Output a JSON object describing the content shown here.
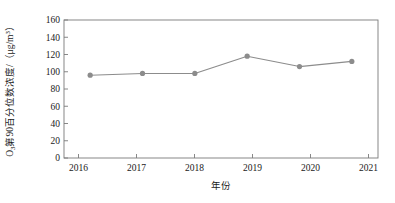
{
  "chart_data": {
    "type": "line",
    "title": "",
    "subtitle": "",
    "xlabel": "年份",
    "ylabel": "O3第90百分位数浓度/（μg/m3）",
    "ylabel_parts": {
      "lead": "O",
      "lead_sub": "3",
      "middle": "第90百分位数浓度/（μg/m",
      "unit_sup": "3",
      "tail": "）"
    },
    "categories": [
      "2016",
      "2017",
      "2018",
      "2019",
      "2020",
      "2021"
    ],
    "x": [
      2016,
      2017,
      2018,
      2019,
      2020,
      2021
    ],
    "values": [
      96,
      98,
      98,
      118,
      106,
      112
    ],
    "series": [
      {
        "name": "O3第90百分位数浓度",
        "values": [
          96,
          98,
          98,
          118,
          106,
          112
        ]
      }
    ],
    "ylim": [
      0,
      160
    ],
    "y_ticks": [
      0,
      20,
      40,
      60,
      80,
      100,
      120,
      140,
      160
    ],
    "y_tick_labels": [
      "0",
      "20",
      "40",
      "60",
      "80",
      "100",
      "120",
      "140",
      "160"
    ],
    "x_tick_labels": [
      "2016",
      "2017",
      "2018",
      "2019",
      "2020",
      "2021"
    ],
    "grid": false,
    "legend": false,
    "legend_position": "none",
    "annotations": [],
    "colors": {
      "line": "#8c8c8c",
      "marker": "#8c8c8c",
      "frame": "#7a7a7a",
      "text": "#1a1a1a",
      "background": "#ffffff"
    },
    "marker_shape": "circle"
  }
}
